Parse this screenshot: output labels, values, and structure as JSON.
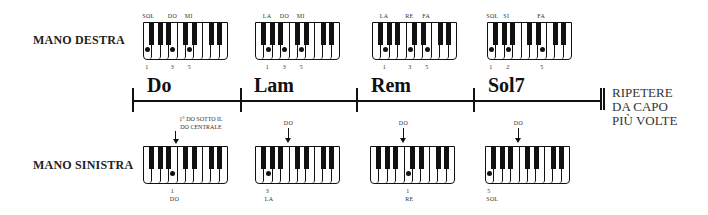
{
  "labels": {
    "right_hand": "MANO DESTRA",
    "left_hand": "MANO SINISTRA",
    "repeat": [
      "RIPETERE",
      "DA CAPO",
      "PIÙ VOLTE"
    ],
    "left_hand_hint": [
      "1° DO SOTTO IL",
      "DO CENTRALE"
    ]
  },
  "chords": [
    {
      "name": "Do",
      "right": {
        "notes": [
          "SOL",
          "DO",
          "MI"
        ],
        "fingers": [
          "1",
          "3",
          "5"
        ],
        "keys": [
          1,
          4,
          6
        ]
      },
      "left": {
        "marker": "DO",
        "finger": "1",
        "note": "DO",
        "key": 4
      }
    },
    {
      "name": "Lam",
      "right": {
        "notes": [
          "LA",
          "DO",
          "MI"
        ],
        "fingers": [
          "1",
          "3",
          "5"
        ],
        "keys": [
          2,
          4,
          6
        ]
      },
      "left": {
        "marker": "DO",
        "finger": "3",
        "note": "LA",
        "key": 2
      }
    },
    {
      "name": "Rem",
      "right": {
        "notes": [
          "LA",
          "RE",
          "FA"
        ],
        "fingers": [
          "1",
          "3",
          "5"
        ],
        "keys": [
          2,
          5,
          7
        ]
      },
      "left": {
        "marker": "DO",
        "finger": "1",
        "note": "RE",
        "key": 5
      }
    },
    {
      "name": "Sol7",
      "right": {
        "notes": [
          "SOL",
          "SI",
          "FA"
        ],
        "fingers": [
          "1",
          "2",
          "5"
        ],
        "keys": [
          1,
          3,
          7
        ]
      },
      "left": {
        "marker": "DO",
        "finger": "5",
        "note": "SOL",
        "key": 1
      }
    }
  ],
  "keyboard": {
    "white_keys": 10,
    "black_after": [
      1,
      2,
      3,
      5,
      6,
      8,
      9
    ]
  }
}
